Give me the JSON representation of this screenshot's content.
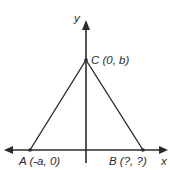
{
  "diagram": {
    "type": "coordinate-plane-triangle",
    "axes": {
      "x_label": "x",
      "y_label": "y"
    },
    "points": [
      {
        "id": "A",
        "label": "A (-a, 0)"
      },
      {
        "id": "B",
        "label": "B (?, ?)"
      },
      {
        "id": "C",
        "label": "C (0, b)"
      }
    ],
    "segments": [
      "AC",
      "CB"
    ],
    "colors": {
      "line": "#2a2a2a",
      "background": "#ffffff"
    }
  }
}
